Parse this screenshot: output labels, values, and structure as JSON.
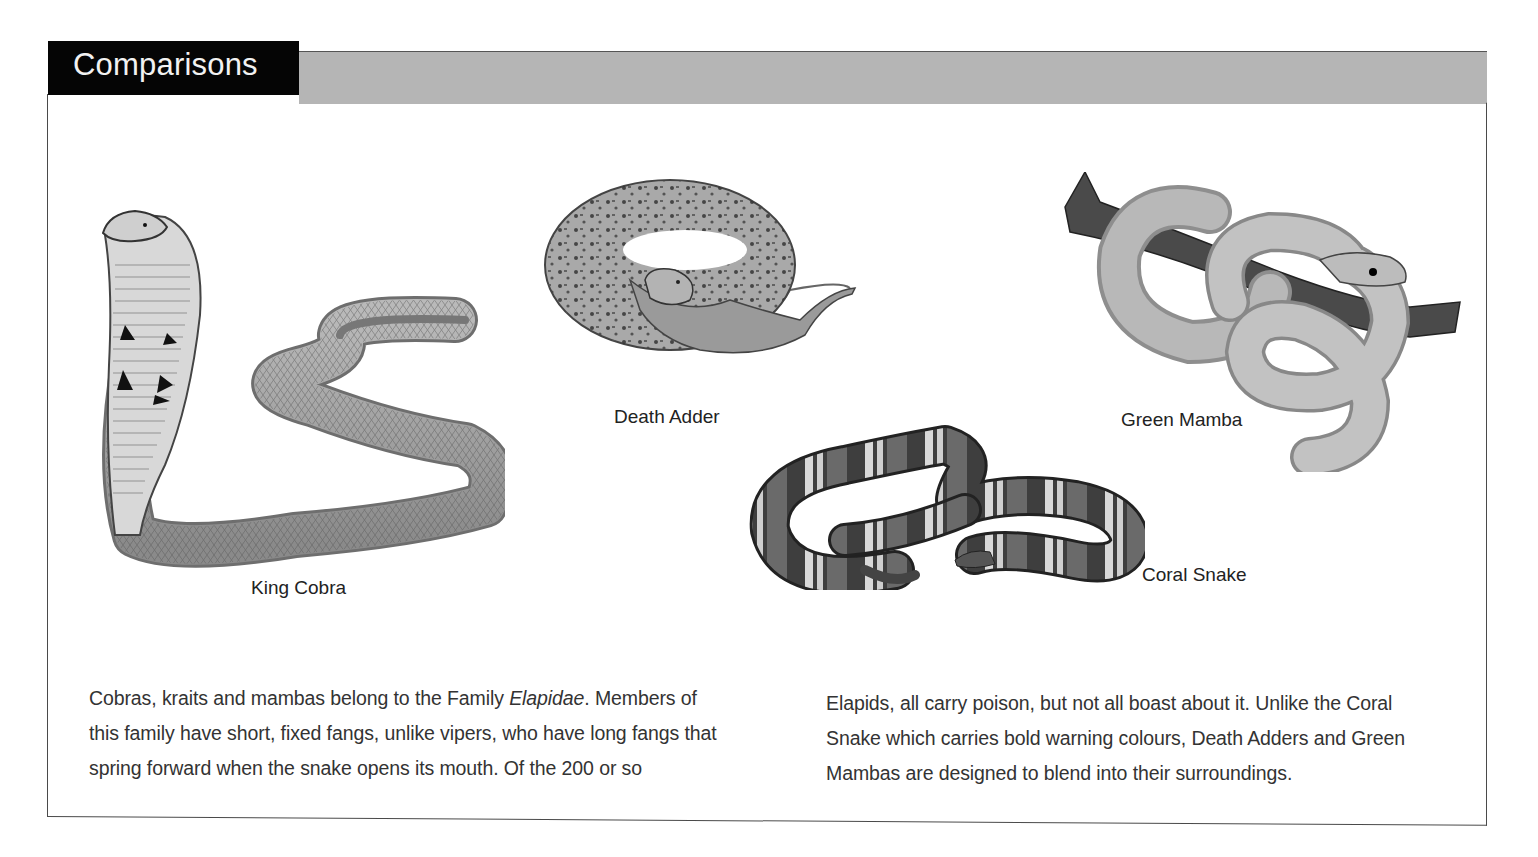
{
  "header": {
    "title": "Comparisons",
    "title_bg": "#050505",
    "bar_color": "#b5b5b5"
  },
  "snakes": [
    {
      "name": "King Cobra"
    },
    {
      "name": "Death Adder"
    },
    {
      "name": "Green Mamba"
    },
    {
      "name": "Coral Snake"
    }
  ],
  "body": {
    "left": {
      "line1_a": "Cobras, kraits and mambas belong to the Family ",
      "line1_em": "Elapidae",
      "line1_b": ". Members of",
      "line2": "this family have short, fixed fangs, unlike vipers, who have long fangs that",
      "line3": "spring forward when the snake opens its mouth. Of the 200 or so"
    },
    "right": {
      "line1": "Elapids, all carry poison, but not all boast about it. Unlike the Coral",
      "line2": "Snake which carries bold warning colours, Death Adders and Green",
      "line3": "Mambas are designed to blend into their surroundings."
    }
  }
}
